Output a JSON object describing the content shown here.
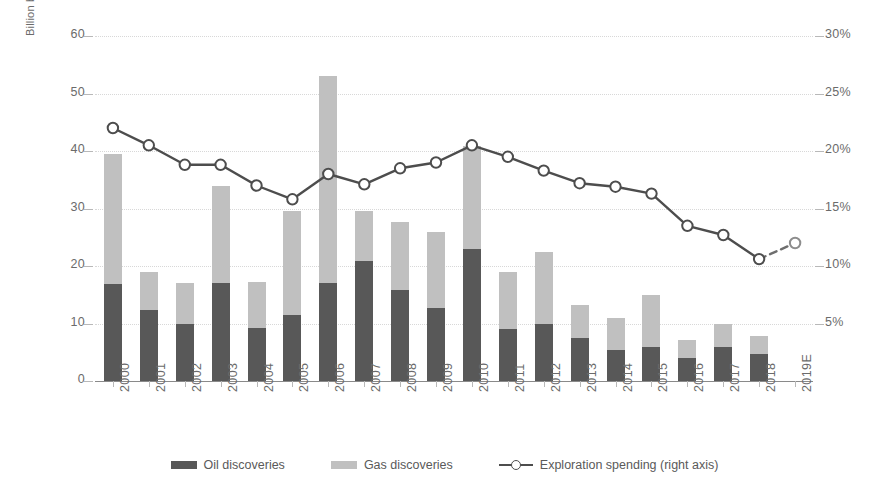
{
  "axes": {
    "left_label": "Billion boe",
    "left_ticks": [
      0,
      10,
      20,
      30,
      40,
      50,
      60
    ],
    "right_ticks": [
      "5%",
      "10%",
      "15%",
      "20%",
      "25%",
      "30%"
    ]
  },
  "legend": {
    "oil": "Oil discoveries",
    "gas": "Gas discoveries",
    "line": "Exploration spending (right axis)"
  },
  "colors": {
    "oil": "#585858",
    "gas": "#c0c0c0",
    "line": "#4d4d4d",
    "grid": "#d8d8d8",
    "text": "#6b6b6b"
  },
  "chart_data": {
    "type": "bar",
    "title": "",
    "subtitle": "",
    "xlabel": "",
    "ylabel": "Billion boe",
    "y2label": "",
    "ylim": [
      0,
      60
    ],
    "y2lim": [
      0,
      30
    ],
    "grid": true,
    "legend_position": "bottom",
    "categories": [
      "2000",
      "2001",
      "2002",
      "2003",
      "2004",
      "2005",
      "2006",
      "2007",
      "2008",
      "2009",
      "2010",
      "2011",
      "2012",
      "2013",
      "2014",
      "2015",
      "2016",
      "2017",
      "2018",
      "2019E"
    ],
    "series": [
      {
        "name": "Oil discoveries",
        "type": "bar",
        "stack": "discoveries",
        "axis": "left",
        "color": "#585858",
        "values": [
          16.8,
          12.3,
          9.9,
          17.0,
          9.2,
          11.4,
          17.0,
          20.9,
          15.8,
          12.7,
          23.0,
          9.0,
          10.0,
          7.4,
          5.4,
          5.9,
          4.0,
          5.9,
          4.7,
          null
        ]
      },
      {
        "name": "Gas discoveries",
        "type": "bar",
        "stack": "discoveries",
        "axis": "left",
        "color": "#c0c0c0",
        "values": [
          22.7,
          6.7,
          7.1,
          17.0,
          8.0,
          18.1,
          36.0,
          8.6,
          11.9,
          13.3,
          17.8,
          10.0,
          12.5,
          5.9,
          5.6,
          9.1,
          3.2,
          4.1,
          3.1,
          null
        ]
      },
      {
        "name": "Exploration spending (right axis)",
        "type": "line",
        "axis": "right",
        "color": "#4d4d4d",
        "marker": "circle-open",
        "values_pct": [
          22.0,
          20.5,
          18.8,
          18.8,
          17.0,
          15.8,
          18.0,
          17.1,
          18.5,
          19.0,
          20.5,
          19.5,
          18.3,
          17.2,
          16.9,
          16.3,
          13.5,
          12.7,
          10.6,
          12.0
        ],
        "dashed_from_index": 18
      }
    ],
    "bar_totals": [
      39.5,
      19.0,
      17.0,
      34.0,
      17.2,
      29.5,
      53.0,
      29.5,
      27.7,
      26.0,
      40.8,
      19.0,
      22.5,
      13.3,
      11.0,
      15.0,
      7.2,
      10.0,
      7.8,
      null
    ]
  }
}
